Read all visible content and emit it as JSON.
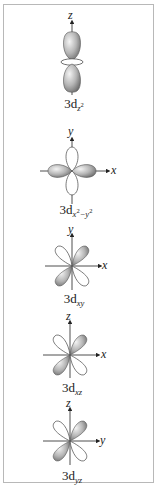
{
  "orbitals": [
    {
      "id": "dz2",
      "label_main": "3d",
      "label_sub": "z",
      "label_sup": "2",
      "axes": [
        "z"
      ]
    },
    {
      "id": "dx2y2",
      "label_main": "3d",
      "label_sub": "x",
      "label_sup": "2",
      "label_sub2": "−y",
      "label_sup2": "2",
      "axes": [
        "y",
        "x"
      ]
    },
    {
      "id": "dxy",
      "label_main": "3d",
      "label_sub": "xy",
      "axes": [
        "y",
        "x"
      ]
    },
    {
      "id": "dxz",
      "label_main": "3d",
      "label_sub": "xz",
      "axes": [
        "z",
        "x"
      ]
    },
    {
      "id": "dyz",
      "label_main": "3d",
      "label_sub": "yz",
      "axes": [
        "z",
        "y"
      ]
    }
  ],
  "colors": {
    "lobe_shaded": "#9a9a9a",
    "lobe_outline": "#555555",
    "border": "#b8b8b8"
  }
}
